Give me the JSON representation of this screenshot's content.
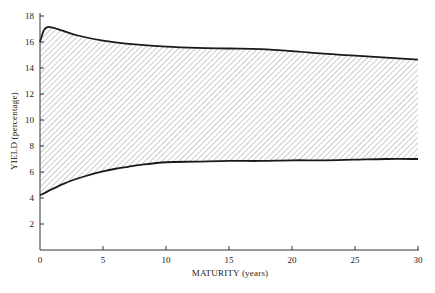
{
  "chart_data": {
    "type": "area",
    "title": "",
    "xlabel": "MATURITY (years)",
    "ylabel": "YIELD (percentage)",
    "xlim": [
      0,
      30
    ],
    "ylim": [
      0,
      18
    ],
    "xticks": [
      0,
      5,
      10,
      15,
      20,
      25,
      30
    ],
    "yticks": [
      2,
      4,
      6,
      8,
      10,
      12,
      14,
      16,
      18
    ],
    "grid": false,
    "legend": null,
    "fill": "diagonal hatching between upper and lower bounds",
    "series": [
      {
        "name": "upper bound",
        "x": [
          0,
          0.3,
          0.6,
          1,
          2,
          3,
          5,
          7,
          10,
          12.5,
          15,
          17.5,
          20,
          22.5,
          25,
          27.5,
          30
        ],
        "values": [
          16.0,
          16.9,
          17.15,
          17.1,
          16.8,
          16.5,
          16.1,
          15.85,
          15.65,
          15.55,
          15.5,
          15.45,
          15.3,
          15.1,
          14.95,
          14.8,
          14.65
        ]
      },
      {
        "name": "lower bound",
        "x": [
          0,
          1,
          2,
          3,
          4,
          5,
          6,
          7,
          8,
          10,
          12.5,
          15,
          17.5,
          20,
          22.5,
          25,
          27.5,
          30
        ],
        "values": [
          4.2,
          4.7,
          5.15,
          5.5,
          5.8,
          6.05,
          6.25,
          6.4,
          6.55,
          6.75,
          6.8,
          6.85,
          6.85,
          6.9,
          6.9,
          6.95,
          7.0,
          7.0
        ]
      }
    ]
  },
  "axes": {
    "x_title": "MATURITY (years)",
    "y_title": "YIELD (percentage)",
    "x_tick_labels": [
      "0",
      "5",
      "10",
      "15",
      "20",
      "25",
      "30"
    ],
    "y_tick_labels": [
      "2",
      "4",
      "6",
      "8",
      "10",
      "12",
      "14",
      "16",
      "18"
    ]
  },
  "colors": {
    "line": "#1a1a1a",
    "hatch": "#9a9a9a",
    "axis": "#333333"
  }
}
